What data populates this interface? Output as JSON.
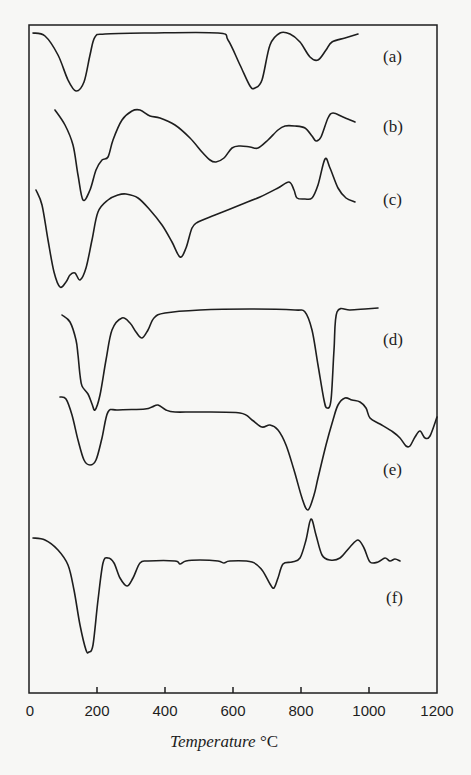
{
  "chart_data": {
    "type": "line",
    "title": "",
    "xlabel": "Temperature",
    "xlabel_unit": "°C",
    "ylabel": "",
    "xlim": [
      0,
      1200
    ],
    "x_ticks": [
      0,
      200,
      400,
      600,
      800,
      1000,
      1200
    ],
    "x_tick_labels": [
      "0",
      "200",
      "400",
      "600",
      "800",
      "1000",
      "1200"
    ],
    "grid": false,
    "legend": "inline labels at right",
    "y_axis_note": "Stacked thermal-analysis traces, no y scale; values are relative vertical offsets (negative = endothermic dip)",
    "series": [
      {
        "name": "(a)",
        "label_pos": [
          395,
          57
        ],
        "features": [
          {
            "type": "dip",
            "temperature": 140
          },
          {
            "type": "dip",
            "temperature": 660
          },
          {
            "type": "dip",
            "temperature": 850
          }
        ],
        "points_px": [
          [
            33,
            33
          ],
          [
            45,
            36
          ],
          [
            58,
            55
          ],
          [
            68,
            80
          ],
          [
            76,
            91
          ],
          [
            84,
            82
          ],
          [
            90,
            55
          ],
          [
            95,
            37
          ],
          [
            105,
            34
          ],
          [
            150,
            33
          ],
          [
            218,
            33
          ],
          [
            228,
            40
          ],
          [
            240,
            65
          ],
          [
            250,
            86
          ],
          [
            255,
            88
          ],
          [
            262,
            80
          ],
          [
            270,
            45
          ],
          [
            280,
            33
          ],
          [
            290,
            34
          ],
          [
            300,
            42
          ],
          [
            310,
            57
          ],
          [
            318,
            60
          ],
          [
            326,
            50
          ],
          [
            332,
            42
          ],
          [
            345,
            38
          ],
          [
            358,
            34
          ]
        ]
      },
      {
        "name": "(b)",
        "label_pos": [
          395,
          127
        ],
        "features": [
          {
            "type": "dip",
            "temperature": 160
          },
          {
            "type": "peak",
            "temperature": 325
          },
          {
            "type": "dip",
            "temperature": 550
          },
          {
            "type": "dip",
            "temperature": 845
          },
          {
            "type": "peak",
            "temperature": 895
          }
        ],
        "points_px": [
          [
            55,
            110
          ],
          [
            65,
            125
          ],
          [
            73,
            145
          ],
          [
            78,
            175
          ],
          [
            83,
            200
          ],
          [
            90,
            190
          ],
          [
            96,
            170
          ],
          [
            102,
            160
          ],
          [
            108,
            157
          ],
          [
            113,
            140
          ],
          [
            122,
            120
          ],
          [
            132,
            111
          ],
          [
            140,
            110
          ],
          [
            150,
            116
          ],
          [
            160,
            118
          ],
          [
            175,
            125
          ],
          [
            190,
            138
          ],
          [
            202,
            152
          ],
          [
            210,
            160
          ],
          [
            216,
            162
          ],
          [
            224,
            158
          ],
          [
            232,
            148
          ],
          [
            240,
            146
          ],
          [
            250,
            147
          ],
          [
            258,
            148
          ],
          [
            268,
            140
          ],
          [
            278,
            130
          ],
          [
            285,
            126
          ],
          [
            295,
            126
          ],
          [
            305,
            128
          ],
          [
            312,
            136
          ],
          [
            316,
            141
          ],
          [
            321,
            137
          ],
          [
            328,
            118
          ],
          [
            333,
            113
          ],
          [
            343,
            117
          ],
          [
            355,
            122
          ]
        ]
      },
      {
        "name": "(c)",
        "label_pos": [
          395,
          200
        ],
        "features": [
          {
            "type": "dip",
            "temperature": 90
          },
          {
            "type": "dip",
            "temperature": 160
          },
          {
            "type": "peak",
            "temperature": 285
          },
          {
            "type": "dip",
            "temperature": 445
          },
          {
            "type": "peak",
            "temperature": 760
          },
          {
            "type": "peak",
            "temperature": 870
          }
        ],
        "points_px": [
          [
            36,
            190
          ],
          [
            42,
            205
          ],
          [
            48,
            240
          ],
          [
            54,
            272
          ],
          [
            60,
            287
          ],
          [
            66,
            282
          ],
          [
            70,
            275
          ],
          [
            75,
            273
          ],
          [
            80,
            280
          ],
          [
            86,
            268
          ],
          [
            92,
            240
          ],
          [
            98,
            212
          ],
          [
            108,
            200
          ],
          [
            118,
            195
          ],
          [
            126,
            194
          ],
          [
            138,
            198
          ],
          [
            150,
            210
          ],
          [
            162,
            225
          ],
          [
            172,
            242
          ],
          [
            180,
            257
          ],
          [
            186,
            248
          ],
          [
            192,
            228
          ],
          [
            198,
            222
          ],
          [
            215,
            215
          ],
          [
            240,
            205
          ],
          [
            260,
            197
          ],
          [
            278,
            188
          ],
          [
            289,
            182
          ],
          [
            294,
            190
          ],
          [
            297,
            198
          ],
          [
            305,
            199
          ],
          [
            312,
            198
          ],
          [
            318,
            185
          ],
          [
            325,
            159
          ],
          [
            330,
            168
          ],
          [
            338,
            188
          ],
          [
            346,
            198
          ],
          [
            355,
            202
          ]
        ]
      },
      {
        "name": "(d)",
        "label_pos": [
          395,
          340
        ],
        "features": [
          {
            "type": "dip",
            "temperature": 195
          },
          {
            "type": "peak",
            "temperature": 275
          },
          {
            "type": "dip",
            "temperature": 335
          },
          {
            "type": "dip",
            "temperature": 880
          }
        ],
        "points_px": [
          [
            62,
            315
          ],
          [
            70,
            322
          ],
          [
            76,
            340
          ],
          [
            78,
            355
          ],
          [
            80,
            375
          ],
          [
            82,
            386
          ],
          [
            88,
            394
          ],
          [
            92,
            404
          ],
          [
            95,
            410
          ],
          [
            100,
            395
          ],
          [
            106,
            360
          ],
          [
            112,
            330
          ],
          [
            122,
            318
          ],
          [
            130,
            323
          ],
          [
            136,
            332
          ],
          [
            142,
            338
          ],
          [
            148,
            330
          ],
          [
            154,
            318
          ],
          [
            165,
            313
          ],
          [
            200,
            310
          ],
          [
            250,
            309
          ],
          [
            295,
            310
          ],
          [
            305,
            312
          ],
          [
            312,
            330
          ],
          [
            318,
            365
          ],
          [
            324,
            400
          ],
          [
            327,
            408
          ],
          [
            331,
            400
          ],
          [
            334,
            350
          ],
          [
            337,
            312
          ],
          [
            350,
            310
          ],
          [
            365,
            309
          ],
          [
            378,
            308
          ]
        ]
      },
      {
        "name": "(e)",
        "label_pos": [
          395,
          470
        ],
        "features": [
          {
            "type": "dip",
            "temperature": 175
          },
          {
            "type": "peak",
            "temperature": 380
          },
          {
            "type": "dip",
            "temperature": 820
          },
          {
            "type": "peak",
            "temperature": 910
          },
          {
            "type": "dip",
            "temperature": 1120
          }
        ],
        "points_px": [
          [
            60,
            397
          ],
          [
            66,
            399
          ],
          [
            72,
            415
          ],
          [
            78,
            440
          ],
          [
            84,
            460
          ],
          [
            90,
            465
          ],
          [
            96,
            460
          ],
          [
            102,
            438
          ],
          [
            108,
            412
          ],
          [
            118,
            410
          ],
          [
            145,
            409
          ],
          [
            152,
            407
          ],
          [
            158,
            405
          ],
          [
            166,
            410
          ],
          [
            175,
            412
          ],
          [
            200,
            412
          ],
          [
            240,
            413
          ],
          [
            252,
            420
          ],
          [
            262,
            427
          ],
          [
            270,
            425
          ],
          [
            278,
            430
          ],
          [
            286,
            445
          ],
          [
            294,
            470
          ],
          [
            302,
            498
          ],
          [
            308,
            510
          ],
          [
            314,
            495
          ],
          [
            318,
            478
          ],
          [
            326,
            445
          ],
          [
            333,
            420
          ],
          [
            338,
            405
          ],
          [
            345,
            398
          ],
          [
            352,
            400
          ],
          [
            360,
            402
          ],
          [
            366,
            408
          ],
          [
            370,
            418
          ],
          [
            380,
            424
          ],
          [
            393,
            432
          ],
          [
            400,
            438
          ],
          [
            406,
            446
          ],
          [
            410,
            446
          ],
          [
            415,
            437
          ],
          [
            420,
            431
          ],
          [
            425,
            438
          ],
          [
            430,
            436
          ],
          [
            437,
            417
          ]
        ]
      },
      {
        "name": "(f)",
        "label_pos": [
          398,
          598
        ],
        "features": [
          {
            "type": "dip",
            "temperature": 180
          },
          {
            "type": "peak",
            "temperature": 225
          },
          {
            "type": "dip",
            "temperature": 290
          },
          {
            "type": "dip",
            "temperature": 720
          },
          {
            "type": "peak",
            "temperature": 830
          },
          {
            "type": "peak",
            "temperature": 975
          }
        ],
        "points_px": [
          [
            33,
            538
          ],
          [
            45,
            540
          ],
          [
            58,
            550
          ],
          [
            68,
            565
          ],
          [
            74,
            590
          ],
          [
            80,
            625
          ],
          [
            86,
            650
          ],
          [
            89,
            652
          ],
          [
            93,
            645
          ],
          [
            98,
            600
          ],
          [
            103,
            563
          ],
          [
            108,
            558
          ],
          [
            114,
            563
          ],
          [
            120,
            578
          ],
          [
            127,
            586
          ],
          [
            133,
            578
          ],
          [
            140,
            563
          ],
          [
            148,
            561
          ],
          [
            175,
            561
          ],
          [
            180,
            564
          ],
          [
            186,
            561
          ],
          [
            200,
            560
          ],
          [
            218,
            561
          ],
          [
            224,
            563
          ],
          [
            230,
            561
          ],
          [
            252,
            562
          ],
          [
            262,
            570
          ],
          [
            270,
            584
          ],
          [
            274,
            588
          ],
          [
            278,
            578
          ],
          [
            283,
            564
          ],
          [
            292,
            562
          ],
          [
            300,
            558
          ],
          [
            306,
            540
          ],
          [
            311,
            519
          ],
          [
            316,
            535
          ],
          [
            322,
            555
          ],
          [
            330,
            560
          ],
          [
            340,
            558
          ],
          [
            350,
            547
          ],
          [
            358,
            540
          ],
          [
            364,
            548
          ],
          [
            370,
            562
          ],
          [
            378,
            562
          ],
          [
            385,
            558
          ],
          [
            390,
            561
          ],
          [
            395,
            559
          ],
          [
            400,
            561
          ]
        ]
      }
    ]
  },
  "axis": {
    "x_title_name": "Temperature",
    "x_title_unit": "°C",
    "tick_labels": [
      "0",
      "200",
      "400",
      "600",
      "800",
      "1000",
      "1200"
    ]
  },
  "labels": {
    "a": "(a)",
    "b": "(b)",
    "c": "(c)",
    "d": "(d)",
    "e": "(e)",
    "f": "(f)"
  },
  "colors": {
    "ink": "#1e1e1e",
    "paper": "#f7f7f5"
  }
}
